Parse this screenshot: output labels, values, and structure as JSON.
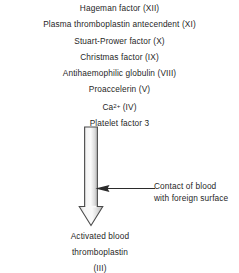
{
  "figure": {
    "type": "flow-diagram",
    "orientation": "top-to-bottom",
    "colors": {
      "text": "#1f1f1f",
      "background": "#ffffff",
      "arrow_outline": "#3a3a3a",
      "arrow_fill_light": "#f2f2f2",
      "arrow_fill_mid": "#c9c9c9",
      "annotation_arrow": "#2b2b2b"
    }
  },
  "inputs": {
    "label": "Clotting factors",
    "items": [
      {
        "name": "Hageman factor",
        "numeral": "(XII)",
        "text": "Hageman factor (XII)"
      },
      {
        "name": "Plasma thromboplastin antecendent",
        "numeral": "(XI)",
        "text": "Plasma thromboplastin antecendent (XI)"
      },
      {
        "name": "Stuart-Prower factor",
        "numeral": "(X)",
        "text": "Stuart-Prower factor (X)"
      },
      {
        "name": "Christmas factor",
        "numeral": "(IX)",
        "text": "Christmas factor (IX)"
      },
      {
        "name": "Antihaemophilic globulin",
        "numeral": "(VIII)",
        "text": "Antihaemophilic globulin (VIII)"
      },
      {
        "name": "Proaccelerin",
        "numeral": "(V)",
        "text": "Proaccelerin (V)"
      },
      {
        "name": "Ca2+",
        "numeral": "(IV)",
        "text": "Ca2+ (IV)",
        "base": "Ca",
        "superscript": "2+",
        "suffix": " (IV)"
      },
      {
        "name": "Platelet factor 3",
        "numeral": "",
        "text": "Platelet factor 3"
      }
    ]
  },
  "arrow": {
    "name": "reaction-arrow",
    "direction": "down",
    "style": "thick-outlined-block-arrow"
  },
  "annotation": {
    "pointer": "left-arrow",
    "line1": "Contact of blood",
    "line2": "with foreign surface"
  },
  "output": {
    "line1": "Activated blood",
    "line2": "thromboplastin",
    "line3": "(III)"
  }
}
